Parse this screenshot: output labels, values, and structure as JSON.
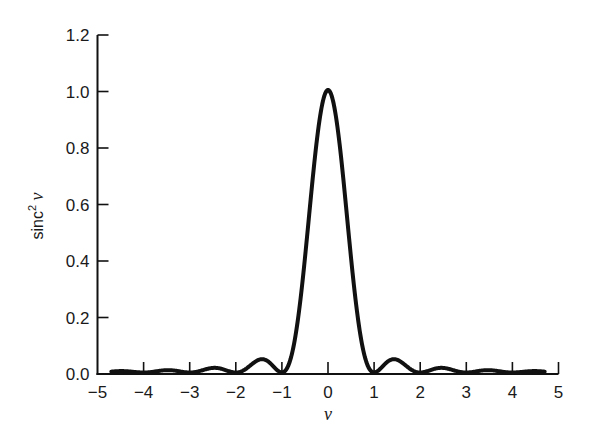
{
  "chart_data": {
    "type": "line",
    "title": "",
    "xlabel": "ν",
    "ylabel": "sinc² ν",
    "ylabel_main": "sinc",
    "ylabel_sup": "2",
    "ylabel_var": "ν",
    "xlim": [
      -5,
      5
    ],
    "ylim": [
      0.0,
      1.2
    ],
    "x_ticks": [
      "−5",
      "−4",
      "−3",
      "−2",
      "−1",
      "0",
      "1",
      "2",
      "3",
      "4",
      "5"
    ],
    "x_tick_values": [
      -5,
      -4,
      -3,
      -2,
      -1,
      0,
      1,
      2,
      3,
      4,
      5
    ],
    "y_ticks": [
      "0.0",
      "0.2",
      "0.4",
      "0.6",
      "0.8",
      "1.0",
      "1.2"
    ],
    "y_tick_values": [
      0.0,
      0.2,
      0.4,
      0.6,
      0.8,
      1.0,
      1.2
    ],
    "grid": false,
    "legend": null,
    "series": [
      {
        "name": "sinc² ν",
        "function": "(sin(πν)/(πν))^2",
        "x_range": [
          -4.7,
          4.7
        ],
        "x": [
          -4.5,
          -3.5,
          -3,
          -2.5,
          -2,
          -1.5,
          -1,
          -0.5,
          0,
          0.5,
          1,
          1.5,
          2,
          2.5,
          3,
          3.5,
          4.5
        ],
        "values": [
          0.005,
          0.008,
          0.0,
          0.016,
          0.0,
          0.045,
          0.0,
          0.405,
          1.0,
          0.405,
          0.0,
          0.045,
          0.0,
          0.016,
          0.0,
          0.008,
          0.005
        ]
      }
    ]
  }
}
